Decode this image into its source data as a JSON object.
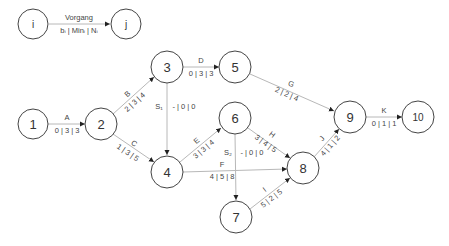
{
  "diagram": {
    "type": "activity-on-arrow network",
    "colors": {
      "line": "#b8b8b8",
      "node_stroke": "#444444",
      "text": "#333333"
    },
    "legend": {
      "from_node": "i",
      "to_node": "j",
      "title": "Vorgang",
      "formula": "bᵢ | Minᵢ | Nᵢ"
    },
    "nodes": [
      {
        "id": "1",
        "x": 33,
        "y": 124
      },
      {
        "id": "2",
        "x": 101,
        "y": 124
      },
      {
        "id": "3",
        "x": 167,
        "y": 67
      },
      {
        "id": "4",
        "x": 167,
        "y": 172
      },
      {
        "id": "5",
        "x": 235,
        "y": 67
      },
      {
        "id": "6",
        "x": 235,
        "y": 118
      },
      {
        "id": "7",
        "x": 236,
        "y": 217
      },
      {
        "id": "8",
        "x": 303,
        "y": 168
      },
      {
        "id": "9",
        "x": 350,
        "y": 117
      },
      {
        "id": "10",
        "x": 418,
        "y": 117
      }
    ],
    "activities": [
      {
        "name": "A",
        "from": "1",
        "to": "2",
        "values": "0 | 3 | 3"
      },
      {
        "name": "B",
        "from": "2",
        "to": "3",
        "values": "2 | 3 | 4"
      },
      {
        "name": "C",
        "from": "2",
        "to": "4",
        "values": "1 | 3 | 5"
      },
      {
        "name": "D",
        "from": "3",
        "to": "5",
        "values": "0 | 3 | 3"
      },
      {
        "name": "S₁",
        "from": "3",
        "to": "4",
        "values": "- | 0 | 0",
        "dummy": true
      },
      {
        "name": "E",
        "from": "4",
        "to": "6",
        "values": "3 | 3 | 4"
      },
      {
        "name": "F",
        "from": "4",
        "to": "8",
        "values": "4 | 5 | 8"
      },
      {
        "name": "G",
        "from": "5",
        "to": "9",
        "values": "2 | 2 | 4"
      },
      {
        "name": "H",
        "from": "6",
        "to": "8",
        "values": "3 | 4 | 5"
      },
      {
        "name": "S₂",
        "from": "6",
        "to": "7",
        "values": "- | 0 | 0",
        "dummy": true
      },
      {
        "name": "I",
        "from": "7",
        "to": "8",
        "values": "5 | 2 | 5"
      },
      {
        "name": "J",
        "from": "8",
        "to": "9",
        "values": "4 | 1 | 2"
      },
      {
        "name": "K",
        "from": "9",
        "to": "10",
        "values": "0 | 1 | 1"
      }
    ]
  }
}
